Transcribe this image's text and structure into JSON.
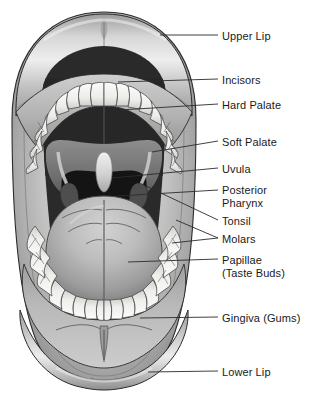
{
  "figure": {
    "colors": {
      "background": "#ffffff",
      "lip_light": "#e8e8e8",
      "lip_mid": "#b8b8b8",
      "lip_dark": "#8f8f8f",
      "tooth": "#f4f4f2",
      "tooth_shadow": "#c9c9c7",
      "hard_palate": "#2a2a2a",
      "soft_palate": "#7a7a7a",
      "pharynx": "#151515",
      "tongue_light": "#c4c4c4",
      "tongue_mid": "#9e9e9e",
      "tongue_dark": "#6f6f6f",
      "gingiva": "#a9a9a9",
      "outline": "#2b2b2b",
      "leader_line": "#2b2b2b",
      "text": "#1a1a1a"
    }
  },
  "labels": [
    {
      "id": "upper-lip",
      "text": "Upper Lip",
      "text2": "",
      "x": 222,
      "y": 30,
      "leader": [
        [
          160,
          35
        ],
        [
          218,
          35
        ]
      ]
    },
    {
      "id": "incisors",
      "text": "Incisors",
      "text2": "",
      "x": 222,
      "y": 74,
      "leader": [
        [
          118,
          82
        ],
        [
          218,
          79
        ]
      ]
    },
    {
      "id": "hard-palate",
      "text": "Hard Palate",
      "text2": "",
      "x": 222,
      "y": 99,
      "leader": [
        [
          120,
          110
        ],
        [
          218,
          104
        ]
      ]
    },
    {
      "id": "soft-palate",
      "text": "Soft Palate",
      "text2": "",
      "x": 222,
      "y": 136,
      "leader": [
        [
          152,
          152
        ],
        [
          218,
          141
        ]
      ]
    },
    {
      "id": "uvula",
      "text": "Uvula",
      "text2": "",
      "x": 222,
      "y": 163,
      "leader": [
        [
          112,
          178
        ],
        [
          218,
          168
        ]
      ]
    },
    {
      "id": "posterior-pharynx",
      "text": "Posterior",
      "text2": "Pharynx",
      "x": 222,
      "y": 184,
      "leader": [
        [
          118,
          196
        ],
        [
          218,
          190
        ]
      ]
    },
    {
      "id": "tonsil",
      "text": "Tonsil",
      "text2": "",
      "x": 222,
      "y": 215,
      "leader": [
        [
          146,
          186
        ],
        [
          218,
          220
        ]
      ]
    },
    {
      "id": "molars",
      "text": "Molars",
      "text2": "",
      "x": 222,
      "y": 233,
      "leader": [
        [
          176,
          220
        ],
        [
          218,
          238
        ]
      ],
      "leader2": [
        [
          172,
          243
        ],
        [
          218,
          238
        ]
      ]
    },
    {
      "id": "papillae",
      "text": "Papillae",
      "text2": "(Taste Buds)",
      "x": 222,
      "y": 254,
      "leader": [
        [
          128,
          262
        ],
        [
          218,
          259
        ]
      ]
    },
    {
      "id": "gingiva",
      "text": "Gingiva (Gums)",
      "text2": "",
      "x": 222,
      "y": 312,
      "leader": [
        [
          140,
          318
        ],
        [
          218,
          317
        ]
      ]
    },
    {
      "id": "lower-lip",
      "text": "Lower Lip",
      "text2": "",
      "x": 222,
      "y": 366,
      "leader": [
        [
          148,
          372
        ],
        [
          218,
          371
        ]
      ]
    }
  ]
}
